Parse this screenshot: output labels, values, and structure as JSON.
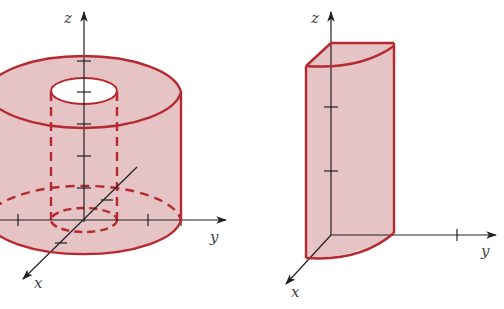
{
  "figures": [
    {
      "id": "left",
      "description": "Hollow cylindrical shell (annular cylinder) about the z-axis",
      "axis_labels": {
        "x": "x",
        "y": "y",
        "z": "z"
      }
    },
    {
      "id": "right",
      "description": "Quarter-cylinder wedge in the first octant",
      "axis_labels": {
        "x": "x",
        "y": "y",
        "z": "z"
      }
    }
  ],
  "colors": {
    "fill": "#e6c3c4",
    "edge": "#b52a30",
    "axis": "#222222",
    "hole": "#ffffff"
  }
}
